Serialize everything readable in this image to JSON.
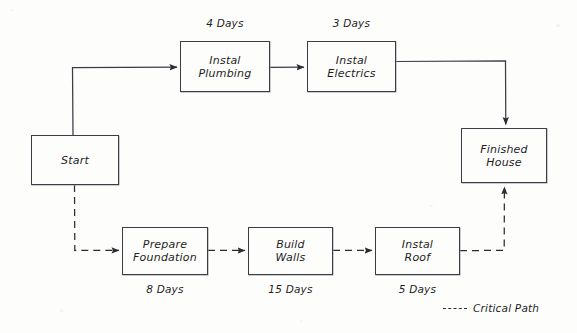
{
  "diagram": {
    "type": "project-network-diagram",
    "style": "hand-drawn-sketch",
    "line_color": "#3c3c46",
    "text_color": "#1d1d24",
    "background_color": "#fdfdfc",
    "nodes": [
      {
        "id": "start",
        "label": "Start",
        "x": 31,
        "y": 135,
        "w": 88,
        "h": 50,
        "duration": null,
        "duration_position": null
      },
      {
        "id": "instal-plumbing",
        "label": "Instal\nPlumbing",
        "x": 180,
        "y": 41,
        "w": 90,
        "h": 51,
        "duration": "4 Days",
        "duration_position": "above"
      },
      {
        "id": "instal-electrics",
        "label": "Instal\nElectrics",
        "x": 307,
        "y": 41,
        "w": 89,
        "h": 51,
        "duration": "3 Days",
        "duration_position": "above"
      },
      {
        "id": "finished-house",
        "label": "Finished\nHouse",
        "x": 461,
        "y": 128,
        "w": 86,
        "h": 55,
        "duration": null,
        "duration_position": null
      },
      {
        "id": "prepare-foundation",
        "label": "Prepare\nFoundation",
        "x": 122,
        "y": 227,
        "w": 86,
        "h": 48,
        "duration": "8 Days",
        "duration_position": "below"
      },
      {
        "id": "build-walls",
        "label": "Build\nWalls",
        "x": 248,
        "y": 227,
        "w": 85,
        "h": 48,
        "duration": "15 Days",
        "duration_position": "below"
      },
      {
        "id": "instal-roof",
        "label": "Instal\nRoof",
        "x": 375,
        "y": 227,
        "w": 85,
        "h": 48,
        "duration": "5 Days",
        "duration_position": "below"
      }
    ],
    "edges": [
      {
        "id": "start-to-plumbing",
        "from": "start",
        "to": "instal-plumbing",
        "style": "solid",
        "arrow": true
      },
      {
        "id": "plumbing-to-electrics",
        "from": "instal-plumbing",
        "to": "instal-electrics",
        "style": "solid",
        "arrow": true
      },
      {
        "id": "electrics-to-finished",
        "from": "instal-electrics",
        "to": "finished-house",
        "style": "solid",
        "arrow": true
      },
      {
        "id": "start-to-foundation",
        "from": "start",
        "to": "prepare-foundation",
        "style": "dashed",
        "arrow": true
      },
      {
        "id": "foundation-to-walls",
        "from": "prepare-foundation",
        "to": "build-walls",
        "style": "dashed",
        "arrow": true
      },
      {
        "id": "walls-to-roof",
        "from": "build-walls",
        "to": "instal-roof",
        "style": "dashed",
        "arrow": true
      },
      {
        "id": "roof-to-finished",
        "from": "instal-roof",
        "to": "finished-house",
        "style": "dashed",
        "arrow": true
      }
    ],
    "legend": {
      "label": "Critical Path",
      "line_style": "dashed",
      "x": 443,
      "y": 302
    }
  }
}
